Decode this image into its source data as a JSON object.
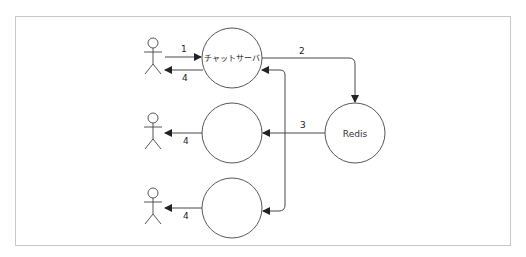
{
  "diagram": {
    "nodes": {
      "chat_server": {
        "label": "チャットサーバ"
      },
      "server2": {
        "label": ""
      },
      "server3": {
        "label": ""
      },
      "redis": {
        "label": "Redis"
      }
    },
    "actors": [
      {
        "id": "actor-1",
        "label": ""
      },
      {
        "id": "actor-2",
        "label": ""
      },
      {
        "id": "actor-3",
        "label": ""
      }
    ],
    "edges": {
      "e1": {
        "label": "1",
        "from": "actor-1",
        "to": "chat_server"
      },
      "e4a": {
        "label": "4",
        "from": "chat_server",
        "to": "actor-1"
      },
      "e2": {
        "label": "2",
        "from": "chat_server",
        "to": "redis"
      },
      "e3": {
        "label": "3",
        "from": "redis",
        "to": "server2"
      },
      "e4b": {
        "label": "4",
        "from": "server2",
        "to": "actor-2"
      },
      "e4c": {
        "label": "4",
        "from": "server3",
        "to": "actor-3"
      }
    },
    "colors": {
      "line": "#333333",
      "frame": "#c8c8c8",
      "background": "#ffffff"
    }
  }
}
